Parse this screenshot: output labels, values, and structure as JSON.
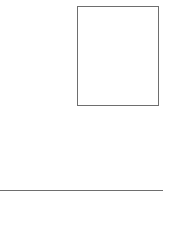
{
  "canvas": {
    "width": 181,
    "height": 242,
    "background": "#ffffff"
  },
  "shapes": [
    {
      "type": "rectangle",
      "label": "",
      "x": 77,
      "y": 6,
      "width": 82,
      "height": 100,
      "stroke": "#6e6e6e",
      "fill": "#ffffff"
    },
    {
      "type": "line",
      "label": "",
      "x1": 0,
      "y1": 190,
      "x2": 163,
      "y2": 190,
      "stroke": "#6e6e6e"
    }
  ]
}
